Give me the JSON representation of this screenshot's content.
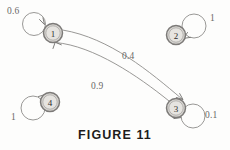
{
  "figure": {
    "caption": "FIGURE 11",
    "type": "state-transition-diagram",
    "nodes": [
      {
        "id": "1",
        "label": "1",
        "cx": 53,
        "cy": 33
      },
      {
        "id": "2",
        "label": "2",
        "cx": 176,
        "cy": 35
      },
      {
        "id": "3",
        "label": "3",
        "cx": 176,
        "cy": 108
      },
      {
        "id": "4",
        "label": "4",
        "cx": 50,
        "cy": 102
      }
    ],
    "edges": [
      {
        "from": "1",
        "to": "1",
        "type": "self-loop",
        "weight": "0.6",
        "label_x": 7,
        "label_y": 6
      },
      {
        "from": "2",
        "to": "2",
        "type": "self-loop",
        "weight": "1",
        "label_x": 210,
        "label_y": 13
      },
      {
        "from": "3",
        "to": "3",
        "type": "self-loop",
        "weight": "0.1",
        "label_x": 205,
        "label_y": 110
      },
      {
        "from": "4",
        "to": "4",
        "type": "self-loop",
        "weight": "1",
        "label_x": 11,
        "label_y": 112
      },
      {
        "from": "1",
        "to": "3",
        "type": "curve",
        "weight": "0.4",
        "label_x": 122,
        "label_y": 51
      },
      {
        "from": "3",
        "to": "1",
        "type": "curve",
        "weight": "0.9",
        "label_x": 91,
        "label_y": 81
      }
    ],
    "colors": {
      "node_fill": "#d8d6d2",
      "node_stroke": "#7c7a78",
      "edge_stroke": "#8d8c8a",
      "label_text": "#6a6967",
      "caption_text": "#1d1c1b",
      "background": "#fdfdfc"
    }
  }
}
